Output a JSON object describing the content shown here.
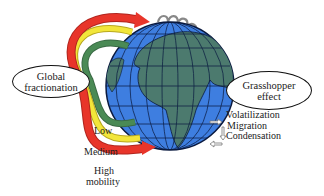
{
  "diagram": {
    "labels": {
      "global_fractionation": [
        "Global",
        "fractionation"
      ],
      "grasshopper_effect": [
        "Grasshopper",
        "effect"
      ],
      "process_steps": [
        "Volatilization",
        "Migration",
        "Condensation"
      ],
      "mobility": {
        "low": "Low",
        "medium": "Medium",
        "high": [
          "High",
          "mobility"
        ]
      }
    },
    "colors": {
      "ocean": "#3f7fe0",
      "land": "#4d7a6e",
      "grid": "#0a1a40",
      "high_arrow": "#e8352a",
      "medium_arrow": "#f2e63a",
      "low_arrow": "#4a8a55",
      "loop": "#8a8a8a"
    }
  }
}
